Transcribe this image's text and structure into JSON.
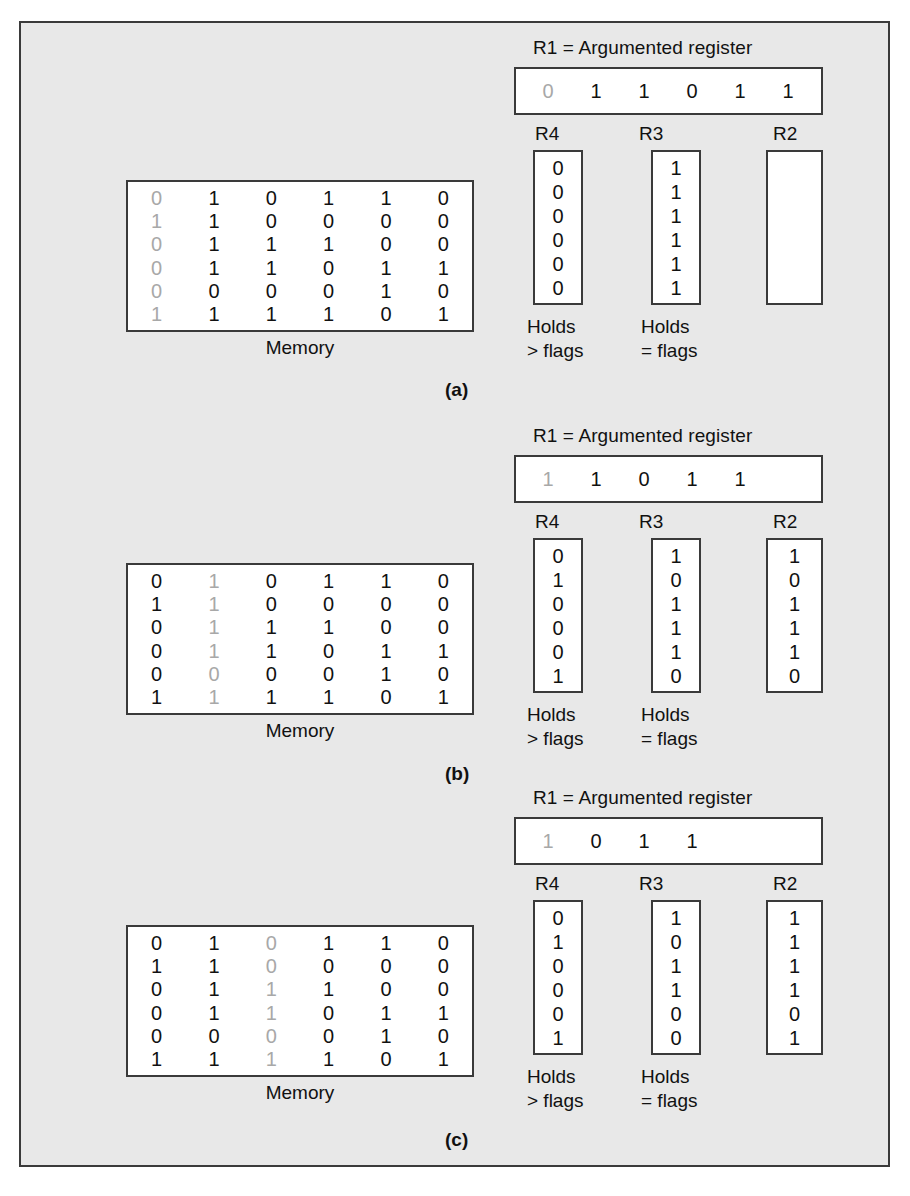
{
  "figure": {
    "background_color": "#e8e8e8",
    "border_color": "#3a3a3a",
    "box_fill": "#ffffff",
    "text_color": "#111111",
    "dim_text_color": "#a8a8a8"
  },
  "labels": {
    "r1_title": "R1 = Argumented register",
    "memory": "Memory",
    "r4": "R4",
    "r3": "R3",
    "r2": "R2",
    "holds_gt": "Holds\n> flags",
    "holds_eq": "Holds\n= flags"
  },
  "panels": [
    {
      "tag": "(a)",
      "r1": {
        "title": "R1 = Argumented register",
        "bits": [
          "0",
          "1",
          "1",
          "0",
          "1",
          "1"
        ],
        "dim_index": 0
      },
      "memory": {
        "label": "Memory",
        "rows": [
          [
            "0",
            "1",
            "0",
            "1",
            "1",
            "0"
          ],
          [
            "1",
            "1",
            "0",
            "0",
            "0",
            "0"
          ],
          [
            "0",
            "1",
            "1",
            "1",
            "0",
            "0"
          ],
          [
            "0",
            "1",
            "1",
            "0",
            "1",
            "1"
          ],
          [
            "0",
            "0",
            "0",
            "0",
            "1",
            "0"
          ],
          [
            "1",
            "1",
            "1",
            "1",
            "0",
            "1"
          ]
        ],
        "dim_column": 0
      },
      "registers": [
        {
          "name": "R4",
          "bits": [
            "0",
            "0",
            "0",
            "0",
            "0",
            "0"
          ],
          "note": "Holds\n> flags"
        },
        {
          "name": "R3",
          "bits": [
            "1",
            "1",
            "1",
            "1",
            "1",
            "1"
          ],
          "note": "Holds\n= flags"
        },
        {
          "name": "R2",
          "bits": [],
          "note": ""
        }
      ]
    },
    {
      "tag": "(b)",
      "r1": {
        "title": "R1 = Argumented register",
        "bits": [
          "1",
          "1",
          "0",
          "1",
          "1"
        ],
        "dim_index": 0
      },
      "memory": {
        "label": "Memory",
        "rows": [
          [
            "0",
            "1",
            "0",
            "1",
            "1",
            "0"
          ],
          [
            "1",
            "1",
            "0",
            "0",
            "0",
            "0"
          ],
          [
            "0",
            "1",
            "1",
            "1",
            "0",
            "0"
          ],
          [
            "0",
            "1",
            "1",
            "0",
            "1",
            "1"
          ],
          [
            "0",
            "0",
            "0",
            "0",
            "1",
            "0"
          ],
          [
            "1",
            "1",
            "1",
            "1",
            "0",
            "1"
          ]
        ],
        "dim_column": 1
      },
      "registers": [
        {
          "name": "R4",
          "bits": [
            "0",
            "1",
            "0",
            "0",
            "0",
            "1"
          ],
          "note": "Holds\n> flags"
        },
        {
          "name": "R3",
          "bits": [
            "1",
            "0",
            "1",
            "1",
            "1",
            "0"
          ],
          "note": "Holds\n= flags"
        },
        {
          "name": "R2",
          "bits": [
            "1",
            "0",
            "1",
            "1",
            "1",
            "0"
          ],
          "note": ""
        }
      ]
    },
    {
      "tag": "(c)",
      "r1": {
        "title": "R1 = Argumented register",
        "bits": [
          "1",
          "0",
          "1",
          "1"
        ],
        "dim_index": 0
      },
      "memory": {
        "label": "Memory",
        "rows": [
          [
            "0",
            "1",
            "0",
            "1",
            "1",
            "0"
          ],
          [
            "1",
            "1",
            "0",
            "0",
            "0",
            "0"
          ],
          [
            "0",
            "1",
            "1",
            "1",
            "0",
            "0"
          ],
          [
            "0",
            "1",
            "1",
            "0",
            "1",
            "1"
          ],
          [
            "0",
            "0",
            "0",
            "0",
            "1",
            "0"
          ],
          [
            "1",
            "1",
            "1",
            "1",
            "0",
            "1"
          ]
        ],
        "dim_column": 2
      },
      "registers": [
        {
          "name": "R4",
          "bits": [
            "0",
            "1",
            "0",
            "0",
            "0",
            "1"
          ],
          "note": "Holds\n> flags"
        },
        {
          "name": "R3",
          "bits": [
            "1",
            "0",
            "1",
            "1",
            "0",
            "0"
          ],
          "note": "Holds\n= flags"
        },
        {
          "name": "R2",
          "bits": [
            "1",
            "1",
            "1",
            "1",
            "0",
            "1"
          ],
          "note": ""
        }
      ]
    }
  ]
}
